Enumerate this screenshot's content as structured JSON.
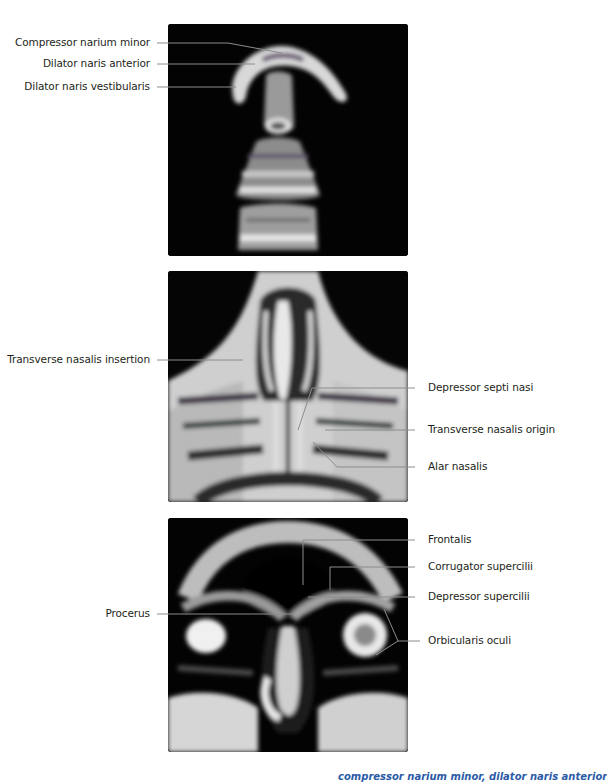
{
  "figure": {
    "panels": [
      {
        "id": "panel-1",
        "view": "axial MRI through nasal tip",
        "labels": [
          {
            "text": "Compressor narium minor",
            "side": "left"
          },
          {
            "text": "Dilator naris anterior",
            "side": "left"
          },
          {
            "text": "Dilator naris vestibularis",
            "side": "left"
          }
        ]
      },
      {
        "id": "panel-2",
        "view": "coronal MRI through nasal pyramid",
        "labels": [
          {
            "text": "Transverse nasalis insertion",
            "side": "left"
          },
          {
            "text": "Depressor septi nasi",
            "side": "right"
          },
          {
            "text": "Transverse nasalis origin",
            "side": "right"
          },
          {
            "text": "Alar nasalis",
            "side": "right"
          }
        ]
      },
      {
        "id": "panel-3",
        "view": "coronal MRI through glabella and orbits",
        "labels": [
          {
            "text": "Procerus",
            "side": "left"
          },
          {
            "text": "Frontalis",
            "side": "right"
          },
          {
            "text": "Corrugator supercilii",
            "side": "right"
          },
          {
            "text": "Depressor supercilii",
            "side": "right"
          },
          {
            "text": "Orbicularis oculi",
            "side": "right"
          }
        ]
      }
    ],
    "caption": {
      "visible_fragment_start": "",
      "visible_fragment_end": "compressor narium minor, dilator naris anterior",
      "note": "caption text is cropped at bottom edge"
    },
    "colors": {
      "label_text": "#231f20",
      "leader_line": "#808285",
      "panel_bg": "#000000",
      "caption_highlight": "#2b5aa6"
    }
  }
}
